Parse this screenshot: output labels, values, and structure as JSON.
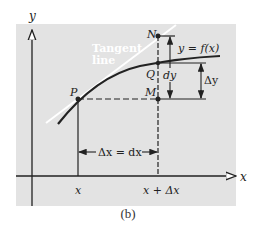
{
  "figure": {
    "caption": "(b)",
    "background_color": "#e3e3e3",
    "axes": {
      "x_label": "x",
      "y_label": "y"
    },
    "points": {
      "P": "P",
      "Q": "Q",
      "M": "M",
      "N": "N"
    },
    "tangent_label_line1": "Tangent",
    "tangent_label_line2": "line",
    "curve_label": "y = f(x)",
    "dy_label": "dy",
    "delta_y_label": "Δy",
    "delta_x_label": "Δx = dx",
    "tick_x": "x",
    "tick_x_plus_dx": "x + Δx"
  }
}
